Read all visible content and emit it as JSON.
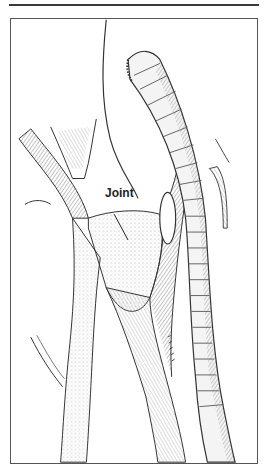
{
  "figure": {
    "labels": [
      {
        "text": "Joint",
        "target": "branch-junction"
      }
    ],
    "colors": {
      "ink": "#2e2e2e",
      "shade": "#777777",
      "frame": "#555555",
      "paper": "#ffffff"
    }
  }
}
